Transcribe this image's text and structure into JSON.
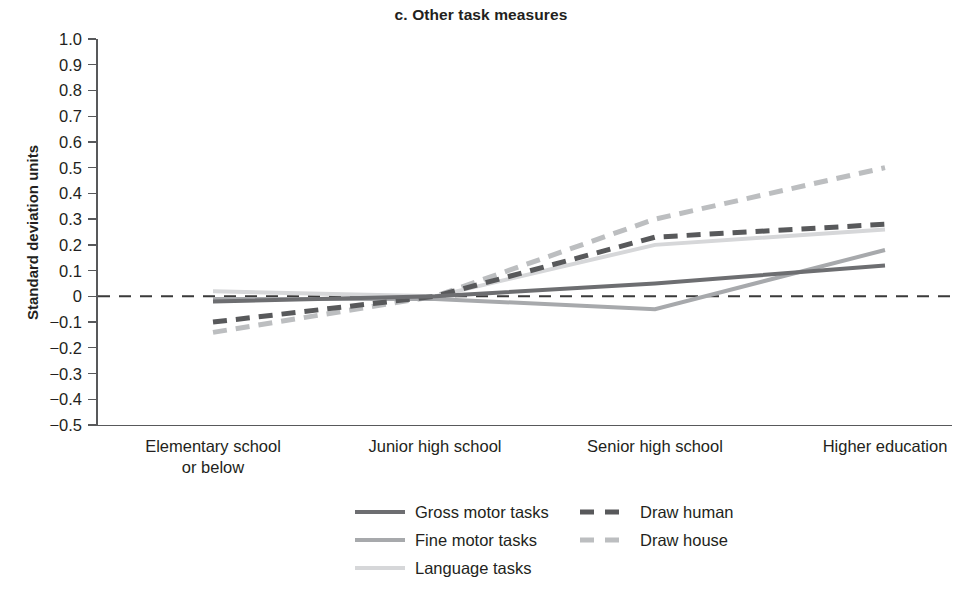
{
  "chart_data": {
    "type": "line",
    "title": "c. Other task measures",
    "xlabel": "",
    "ylabel": "Standard deviation units",
    "categories": [
      "Elementary school or below",
      "Junior high school",
      "Senior high school",
      "Higher education"
    ],
    "category_lines": [
      [
        "Elementary school",
        "or below"
      ],
      [
        "Junior high school"
      ],
      [
        "Senior high school"
      ],
      [
        "Higher education"
      ]
    ],
    "ylim": [
      -0.5,
      1.0
    ],
    "ytick_labels": [
      "1.0",
      "0.9",
      "0.8",
      "0.7",
      "0.6",
      "0.5",
      "0.4",
      "0.3",
      "0.2",
      "0.1",
      "0",
      "−0.1",
      "−0.2",
      "−0.3",
      "−0.4",
      "−0.5"
    ],
    "ytick_values": [
      1.0,
      0.9,
      0.8,
      0.7,
      0.6,
      0.5,
      0.4,
      0.3,
      0.2,
      0.1,
      0.0,
      -0.1,
      -0.2,
      -0.3,
      -0.4,
      -0.5
    ],
    "grid": false,
    "zero_reference_line": {
      "value": 0,
      "style": "dashed",
      "color": "#3a3a3a"
    },
    "legend_position": "bottom-center",
    "series": [
      {
        "name": "Gross motor tasks",
        "values": [
          -0.02,
          0.0,
          0.05,
          0.12
        ],
        "style": "solid",
        "color": "#6d6e71"
      },
      {
        "name": "Fine motor tasks",
        "values": [
          -0.01,
          -0.01,
          -0.05,
          0.18
        ],
        "style": "solid",
        "color": "#a7a9ac"
      },
      {
        "name": "Language tasks",
        "values": [
          0.02,
          0.0,
          0.2,
          0.26
        ],
        "style": "solid",
        "color": "#d6d7d9"
      },
      {
        "name": "Draw human",
        "values": [
          -0.1,
          0.0,
          0.23,
          0.28
        ],
        "style": "dashed",
        "color": "#58595b"
      },
      {
        "name": "Draw house",
        "values": [
          -0.14,
          0.0,
          0.3,
          0.5
        ],
        "style": "dashed",
        "color": "#bcbec0"
      }
    ]
  }
}
